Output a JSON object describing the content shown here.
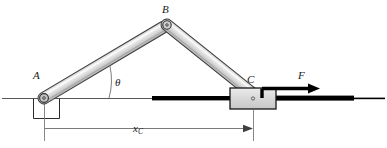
{
  "figure": {
    "name": "slider-crank-mechanism-diagram",
    "type": "engineering-mechanism-schematic",
    "background_color": "#ffffff"
  },
  "labels": {
    "pin_a": "A",
    "joint_b": "B",
    "slider_c": "C",
    "force": "F",
    "angle": "θ",
    "dimension_symbol": "x",
    "dimension_subscript": "C"
  },
  "colors": {
    "link_fill": "#d9d9d9",
    "link_highlight": "#f2f2f2",
    "link_outline": "#3d3d3d",
    "slider_fill": "#d9d9d9",
    "slider_outline": "#1a1a1a",
    "ground_line": "#4d4d4d",
    "rod": "#000000",
    "dimension_line": "#6b6b6b",
    "text": "#1a1a1a"
  },
  "geometry": {
    "ground_y": 98,
    "pin_a": {
      "x": 44,
      "y": 98
    },
    "joint_b": {
      "x": 167,
      "y": 25
    },
    "slider_c": {
      "x": 258,
      "y": 98
    },
    "link_ab_label": "link AB",
    "link_bc_label": "link BC",
    "angle_value_deg": 31,
    "arc_radius": 65,
    "force_arrow": {
      "from_x": 262,
      "to_x": 300,
      "y": 80
    },
    "dimension": {
      "from_x": 44,
      "to_x": 258,
      "y": 128
    }
  },
  "parts": [
    {
      "id": "ground-line",
      "label": "horizontal ground reference line"
    },
    {
      "id": "pin-support-a",
      "label": "pin support bracket at A"
    },
    {
      "id": "link-ab",
      "label": "upper left link from A to B"
    },
    {
      "id": "link-bc",
      "label": "upper right link from B to C"
    },
    {
      "id": "pin-joint-a",
      "label": "pin joint at A"
    },
    {
      "id": "pin-joint-b",
      "label": "pin joint at B"
    },
    {
      "id": "slider-block",
      "label": "slider block at C"
    },
    {
      "id": "guide-rod",
      "label": "horizontal guide rod through slider"
    },
    {
      "id": "force-arrow",
      "label": "applied force arrow F"
    },
    {
      "id": "angle-arc",
      "label": "angle theta arc"
    },
    {
      "id": "dimension-xc",
      "label": "horizontal dimension x sub C"
    }
  ]
}
